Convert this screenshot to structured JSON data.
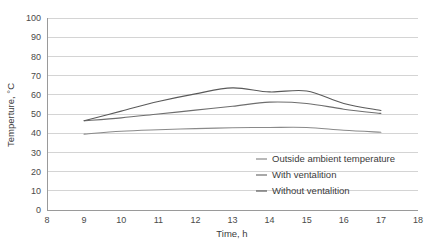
{
  "chart_data": {
    "type": "line",
    "title": "",
    "xlabel": "Time, h",
    "ylabel": "Temperture, °C",
    "xlim": [
      8,
      18
    ],
    "ylim": [
      0,
      100
    ],
    "xticks": [
      "8",
      "9",
      "10",
      "11",
      "12",
      "13",
      "14",
      "15",
      "16",
      "17",
      "18"
    ],
    "yticks": [
      "0",
      "10",
      "20",
      "30",
      "40",
      "50",
      "60",
      "70",
      "80",
      "90",
      "100"
    ],
    "grid": "horizontal",
    "legend_position": "inside-lower-right",
    "x": [
      9,
      10,
      11,
      12,
      13,
      14,
      15,
      16,
      17
    ],
    "series": [
      {
        "name": "Outside ambient temperature",
        "color": "#8a8a8a",
        "values": [
          39.5,
          41.0,
          41.8,
          42.4,
          42.8,
          43.0,
          43.0,
          41.5,
          40.5
        ]
      },
      {
        "name": "With ventalition",
        "color": "#6e6e6e",
        "values": [
          46.5,
          48.0,
          50.0,
          52.0,
          54.0,
          56.2,
          55.5,
          52.5,
          50.3
        ]
      },
      {
        "name": "Without ventalition",
        "color": "#5a5a5a",
        "values": [
          46.5,
          51.5,
          56.5,
          60.5,
          63.6,
          61.5,
          62.0,
          55.5,
          51.8
        ]
      }
    ]
  },
  "axes": {
    "x_title": "Time, h",
    "y_title": "Temperture, °C"
  },
  "legend": {
    "items": [
      {
        "label": "Outside ambient temperature"
      },
      {
        "label": "With ventalition"
      },
      {
        "label": "Without ventalition"
      }
    ]
  },
  "colors": {
    "gridline": "#c9c9c9",
    "axis": "#9a9a9a",
    "text": "#3b3b3b",
    "background": "#ffffff"
  }
}
